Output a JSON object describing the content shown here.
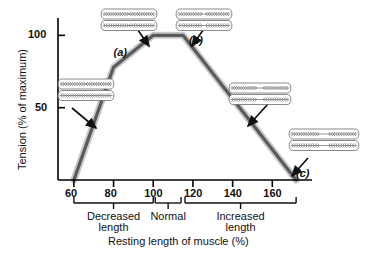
{
  "figure": {
    "type": "length-tension-curve",
    "background": "#ffffff",
    "curve_color": "#5a5a5a",
    "curve_halo_color": "#c9c9c9",
    "axis_color": "#000000"
  },
  "chart_data": {
    "type": "line",
    "title": "",
    "xlabel": "Resting length of muscle (%)",
    "ylabel": "Tension (% of maximum)",
    "xlim": [
      52,
      180
    ],
    "ylim": [
      0,
      112
    ],
    "grid": false,
    "legend": "none",
    "x_ticks": [
      60,
      80,
      100,
      120,
      140,
      160
    ],
    "x_tick_labels": [
      "60",
      "80",
      "100",
      "120",
      "140",
      "160"
    ],
    "y_ticks": [
      50,
      100
    ],
    "y_tick_labels": [
      "50",
      "100"
    ],
    "series": [
      {
        "name": "Tension",
        "x": [
          60,
          80,
          100,
          115,
          172
        ],
        "values": [
          0,
          78,
          100,
          100,
          0
        ]
      }
    ],
    "annotations": [
      {
        "id": "a",
        "label": "(a)",
        "x": 84,
        "y": 88
      },
      {
        "id": "b",
        "label": "(b)",
        "x": 122,
        "y": 96
      },
      {
        "id": "c",
        "label": "(c)",
        "x": 176,
        "y": 4
      }
    ],
    "x_ranges": [
      {
        "label_line1": "Decreased",
        "label_line2": "length",
        "from": 60,
        "to": 100
      },
      {
        "label_line1": "Normal",
        "label_line2": "",
        "from": 101,
        "to": 114
      },
      {
        "label_line1": "Increased",
        "label_line2": "length",
        "from": 116,
        "to": 172
      }
    ]
  },
  "sarcomeres": [
    {
      "id": "sarcomere-a",
      "state": "overlapped",
      "description": "Sarcomere at decreased length - thick filaments compressed against Z lines",
      "gap": 0
    },
    {
      "id": "sarcomere-peak-left",
      "state": "optimal",
      "description": "Sarcomere at optimal overlap - maximum cross-bridge formation",
      "gap": 0
    },
    {
      "id": "sarcomere-b",
      "state": "slightly-stretched",
      "description": "Sarcomere slightly stretched - small central gap",
      "gap": 1
    },
    {
      "id": "sarcomere-stretched",
      "state": "stretched",
      "description": "Sarcomere stretched - reduced filament overlap",
      "gap": 2
    },
    {
      "id": "sarcomere-c",
      "state": "overstretched",
      "description": "Sarcomere overstretched - no filament overlap, zero tension",
      "gap": 3
    }
  ],
  "arrows": [
    {
      "name": "arrow-to-peak-left",
      "points_to": "curve-peak-start"
    },
    {
      "name": "arrow-to-peak-right",
      "points_to": "curve-peak-end"
    },
    {
      "name": "arrow-to-ascending-limb",
      "points_to": "curve-ascending"
    },
    {
      "name": "arrow-to-descending-limb",
      "points_to": "curve-descending"
    },
    {
      "name": "arrow-to-curve-end",
      "points_to": "curve-zero-right"
    }
  ]
}
